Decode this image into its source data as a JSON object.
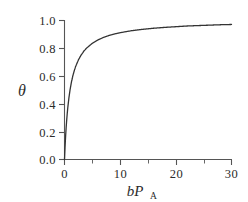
{
  "chart_data": {
    "type": "line",
    "title": "",
    "subtitle": "",
    "xlabel": "bP_A",
    "xlabel_main": "bP",
    "xlabel_subscript": "A",
    "ylabel": "θ",
    "ylabel_symbol": "θ",
    "xlim": [
      0,
      30
    ],
    "ylim": [
      0,
      1.0
    ],
    "grid": false,
    "legend": null,
    "legend_position": "none",
    "x_major_ticks": [
      0,
      10,
      20,
      30
    ],
    "x_minor_ticks": [
      5,
      15,
      25
    ],
    "x_tick_labels": [
      "0",
      "10",
      "20",
      "30"
    ],
    "y_major_ticks": [
      0.0,
      0.2,
      0.4,
      0.6,
      0.8,
      1.0
    ],
    "y_tick_labels": [
      "0.0",
      "0.2",
      "0.4",
      "0.6",
      "0.8",
      "1.0"
    ],
    "tick_direction": "out",
    "curve_color": "#333333",
    "axis_color": "#555555",
    "background_color": "#ffffff",
    "equation": "theta = bP_A / (1 + bP_A)",
    "series": [
      {
        "name": "Langmuir isotherm",
        "x": [
          0,
          0.1,
          0.2,
          0.3,
          0.4,
          0.5,
          0.6,
          0.8,
          1.0,
          1.25,
          1.5,
          1.75,
          2.0,
          2.5,
          3.0,
          3.5,
          4.0,
          5.0,
          6.0,
          7.0,
          8.0,
          9.0,
          10.0,
          12.0,
          14.0,
          16.0,
          18.0,
          20.0,
          22.0,
          24.0,
          26.0,
          28.0,
          30.0
        ],
        "y": [
          0.0,
          0.091,
          0.167,
          0.231,
          0.286,
          0.333,
          0.375,
          0.444,
          0.5,
          0.556,
          0.6,
          0.636,
          0.667,
          0.714,
          0.75,
          0.778,
          0.8,
          0.833,
          0.857,
          0.875,
          0.889,
          0.9,
          0.909,
          0.923,
          0.933,
          0.941,
          0.947,
          0.952,
          0.957,
          0.96,
          0.963,
          0.966,
          0.968
        ]
      }
    ]
  }
}
